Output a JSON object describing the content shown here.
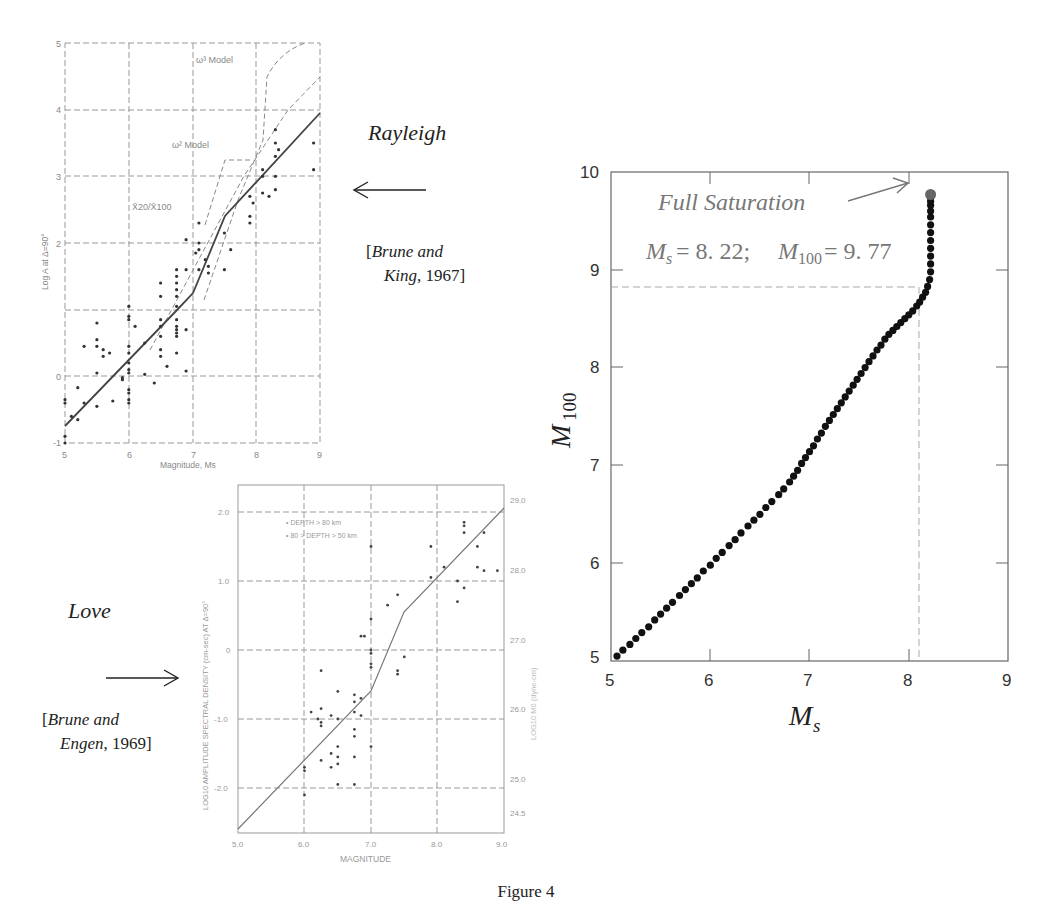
{
  "figure": {
    "caption": "Figure 4"
  },
  "annotations": {
    "rayleigh": {
      "title": "Rayleigh",
      "ref_line1_open": "[",
      "ref_line1_italic": "Brune and",
      "ref_line2_italic": "King",
      "ref_line2_rest": ", 1967]",
      "arrow": "arrow-left-icon"
    },
    "love": {
      "title": "Love",
      "ref_line1_open": "[",
      "ref_line1_italic": "Brune and",
      "ref_line2_italic": "Engen",
      "ref_line2_rest": ", 1969]",
      "arrow": "arrow-right-icon"
    }
  },
  "chart_data": [
    {
      "id": "rayleigh-scan",
      "type": "scatter",
      "title": "",
      "xlabel": "Magnitude, Ms",
      "ylabel": "Log A at Δ=90°",
      "xlim": [
        5,
        9
      ],
      "ylim": [
        -1,
        5
      ],
      "xticks": [
        "5",
        "6",
        "7",
        "8",
        "9"
      ],
      "yticks": [
        "-1",
        "0",
        "",
        "2",
        "3",
        "4",
        "5"
      ],
      "grid": true,
      "curve_labels": [
        "ω³ Model",
        "ω² Model",
        "X̄20/X̄100"
      ],
      "series": [
        {
          "name": "observed",
          "x": [
            5.0,
            5.0,
            5.0,
            5.0,
            5.1,
            5.2,
            5.2,
            5.3,
            5.3,
            5.5,
            5.5,
            5.5,
            5.5,
            5.5,
            5.6,
            5.6,
            5.7,
            5.75,
            5.9,
            5.9,
            6.0,
            6.0,
            6.0,
            6.0,
            6.0,
            6.0,
            6.0,
            6.0,
            6.0,
            6.0,
            6.0,
            6.0,
            6.1,
            6.25,
            6.25,
            6.4,
            6.5,
            6.5,
            6.5,
            6.5,
            6.5,
            6.5,
            6.5,
            6.6,
            6.75,
            6.75,
            6.75,
            6.75,
            6.75,
            6.75,
            6.75,
            6.75,
            6.75,
            6.75,
            6.75,
            6.75,
            6.9,
            6.9,
            6.9,
            6.9,
            7.05,
            7.1,
            7.1,
            7.1,
            7.1,
            7.2,
            7.25,
            7.25,
            7.5,
            7.5,
            7.6,
            7.9,
            7.9,
            7.9,
            7.95,
            8.1,
            8.1,
            8.1,
            8.2,
            8.3,
            8.3,
            8.3,
            8.3,
            8.3,
            8.35,
            8.9,
            8.9
          ],
          "y": [
            -0.35,
            -0.4,
            -0.9,
            -1.0,
            -0.6,
            -0.65,
            -0.17,
            0.45,
            -0.4,
            0.8,
            0.55,
            0.45,
            0.05,
            -0.45,
            0.4,
            0.3,
            0.35,
            -0.37,
            -0.02,
            -0.05,
            1.05,
            0.9,
            0.85,
            0.45,
            0.35,
            0.2,
            0.1,
            0.05,
            -0.2,
            -0.25,
            -0.35,
            -0.4,
            0.75,
            0.5,
            0.03,
            -0.1,
            1.4,
            1.2,
            0.85,
            0.75,
            0.6,
            0.4,
            0.3,
            0.15,
            1.6,
            1.5,
            1.4,
            1.3,
            1.2,
            1.05,
            0.85,
            0.7,
            0.6,
            0.35,
            0.65,
            0.75,
            2.05,
            1.6,
            0.7,
            0.08,
            1.85,
            2.3,
            2.0,
            1.9,
            1.6,
            1.75,
            1.65,
            1.55,
            2.15,
            1.6,
            1.9,
            2.3,
            2.4,
            2.7,
            2.6,
            3.1,
            3.0,
            2.75,
            2.7,
            3.7,
            3.5,
            3.3,
            3.0,
            2.8,
            3.4,
            3.5,
            3.1
          ]
        },
        {
          "name": "regression (solid)",
          "x": [
            5.0,
            6.75,
            7.0,
            7.5,
            9.0
          ],
          "y": [
            -0.75,
            1.0,
            1.25,
            2.4,
            3.95
          ]
        },
        {
          "name": "ω² Model (dashed)",
          "x": [
            6.3,
            7.0,
            7.8,
            8.5,
            9.0
          ],
          "y": [
            0.5,
            1.6,
            3.0,
            4.0,
            4.5
          ]
        },
        {
          "name": "ω³ Model (dashed)",
          "x": [
            7.1,
            7.6,
            8.1,
            8.15,
            8.6
          ],
          "y": [
            0.8,
            2.3,
            3.5,
            4.6,
            5.0
          ]
        }
      ]
    },
    {
      "id": "love-scan",
      "type": "scatter",
      "xlabel": "MAGNITUDE",
      "ylabel": "LOG10 AMPLITUDE SPECTRAL DENSITY (cm-sec) AT Δ=90°",
      "ylabel_right": "LOG10 M0 (dyne-cm)",
      "xlim": [
        5.0,
        9.0
      ],
      "ylim": [
        -2.6,
        2.4
      ],
      "xticks": [
        "5.0",
        "6.0",
        "7.0",
        "8.0",
        "9.0"
      ],
      "yticks": [
        "-2.0",
        "-1.0",
        "0",
        "1.0",
        "2.0"
      ],
      "yticks_right": [
        "24.5",
        "25.0",
        "26.0",
        "27.0",
        "28.0",
        "29.0"
      ],
      "legend": [
        "• DEPTH > 80 km",
        "• 80 > DEPTH > 50 km"
      ],
      "grid": true,
      "series": [
        {
          "name": "observed",
          "x": [
            6.0,
            6.0,
            6.0,
            6.1,
            6.2,
            6.25,
            6.25,
            6.25,
            6.25,
            6.25,
            6.4,
            6.4,
            6.4,
            6.5,
            6.5,
            6.5,
            6.5,
            6.5,
            6.5,
            6.75,
            6.75,
            6.75,
            6.75,
            6.75,
            6.75,
            6.75,
            6.85,
            6.85,
            6.85,
            6.9,
            7.0,
            7.0,
            7.0,
            7.0,
            7.0,
            7.0,
            7.0,
            7.25,
            7.4,
            7.4,
            7.4,
            7.5,
            7.9,
            7.9,
            8.1,
            8.3,
            8.3,
            8.4,
            8.4,
            8.4,
            8.4,
            8.6,
            8.6,
            8.7,
            8.7,
            8.9
          ],
          "y": [
            -1.7,
            -1.75,
            -2.1,
            -0.9,
            -1.0,
            -0.3,
            -0.85,
            -1.05,
            -1.1,
            -1.6,
            -0.95,
            -1.5,
            -1.7,
            -0.6,
            -1.0,
            -1.4,
            -1.55,
            -1.65,
            -1.95,
            -0.75,
            -0.65,
            -0.9,
            -1.15,
            -1.25,
            -1.55,
            -1.95,
            -0.7,
            -0.95,
            0.2,
            0.2,
            0.45,
            0.0,
            -0.05,
            -0.2,
            -0.25,
            -1.4,
            1.5,
            0.65,
            0.8,
            -0.3,
            -0.35,
            -0.1,
            1.5,
            1.05,
            1.2,
            0.7,
            1.0,
            1.85,
            1.8,
            1.7,
            0.9,
            1.5,
            1.2,
            1.7,
            1.15,
            1.15
          ]
        },
        {
          "name": "model (solid)",
          "x": [
            5.0,
            7.0,
            7.5,
            9.0
          ],
          "y": [
            -2.6,
            -0.6,
            0.55,
            2.05
          ]
        }
      ]
    },
    {
      "id": "saturation",
      "type": "scatter",
      "title": "",
      "xlabel": "Ms",
      "ylabel": "M100",
      "xlim": [
        5,
        9
      ],
      "ylim": [
        5,
        10
      ],
      "xticks": [
        "5",
        "6",
        "7",
        "8",
        "9"
      ],
      "yticks": [
        "5",
        "6",
        "7",
        "8",
        "9",
        "10"
      ],
      "grid": false,
      "annotation": {
        "text": "Full Saturation",
        "formula": "Ms = 8.22;  M100 = 9.77",
        "point": [
          8.22,
          9.77
        ]
      },
      "reference_lines": {
        "vertical_x": 8.1,
        "horizontal_y": 8.67
      },
      "series": [
        {
          "name": "M100 vs Ms",
          "x": [
            5.06,
            5.12,
            5.19,
            5.25,
            5.31,
            5.38,
            5.44,
            5.5,
            5.56,
            5.62,
            5.69,
            5.75,
            5.81,
            5.87,
            5.93,
            6.0,
            6.06,
            6.12,
            6.19,
            6.25,
            6.31,
            6.38,
            6.44,
            6.5,
            6.56,
            6.62,
            6.69,
            6.74,
            6.8,
            6.84,
            6.88,
            6.92,
            6.96,
            7.0,
            7.04,
            7.08,
            7.12,
            7.16,
            7.2,
            7.24,
            7.28,
            7.32,
            7.36,
            7.4,
            7.44,
            7.48,
            7.52,
            7.56,
            7.6,
            7.64,
            7.68,
            7.72,
            7.76,
            7.8,
            7.84,
            7.88,
            7.92,
            7.96,
            8.0,
            8.04,
            8.08,
            8.11,
            8.14,
            8.17,
            8.19,
            8.21,
            8.22,
            8.22,
            8.22,
            8.22,
            8.22,
            8.22,
            8.22,
            8.22,
            8.22,
            8.22,
            8.22,
            8.22,
            8.22,
            8.22
          ],
          "y": [
            5.05,
            5.11,
            5.17,
            5.23,
            5.29,
            5.35,
            5.42,
            5.48,
            5.54,
            5.6,
            5.67,
            5.73,
            5.79,
            5.85,
            5.92,
            5.98,
            6.05,
            6.11,
            6.18,
            6.24,
            6.31,
            6.38,
            6.44,
            6.5,
            6.57,
            6.63,
            6.7,
            6.76,
            6.83,
            6.89,
            6.95,
            7.02,
            7.08,
            7.14,
            7.2,
            7.27,
            7.33,
            7.4,
            7.46,
            7.52,
            7.58,
            7.64,
            7.7,
            7.76,
            7.82,
            7.88,
            7.94,
            8.0,
            8.06,
            8.12,
            8.18,
            8.23,
            8.29,
            8.34,
            8.38,
            8.42,
            8.46,
            8.5,
            8.54,
            8.58,
            8.63,
            8.67,
            8.72,
            8.77,
            8.83,
            8.9,
            8.98,
            9.06,
            9.14,
            9.22,
            9.3,
            9.38,
            9.46,
            9.54,
            9.6,
            9.66,
            9.7,
            9.74,
            9.76,
            9.77
          ]
        }
      ]
    }
  ]
}
